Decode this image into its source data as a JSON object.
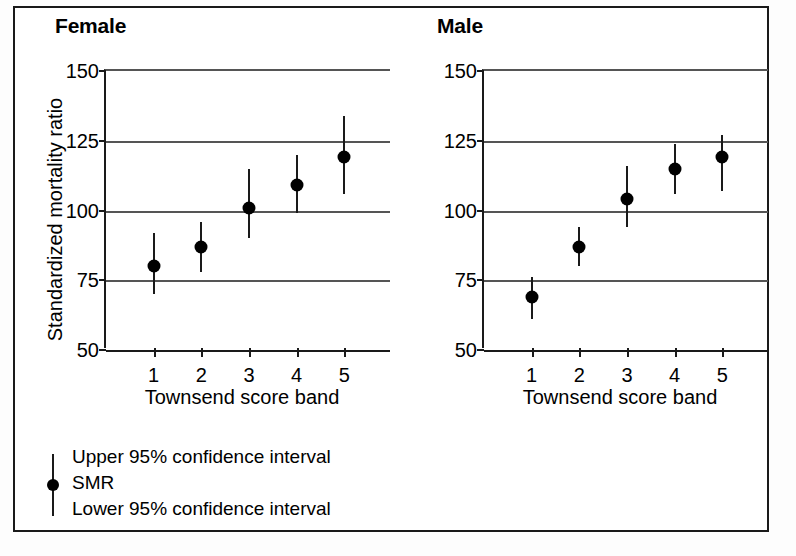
{
  "figure": {
    "y_axis_title": "Standardized mortality ratio",
    "x_axis_title": "Townsend score band"
  },
  "legend": {
    "upper": "Upper 95% confidence interval",
    "smr": "SMR",
    "lower": "Lower 95% confidence interval"
  },
  "chart_data": [
    {
      "type": "scatter",
      "title": "Female",
      "xlabel": "Townsend score band",
      "ylabel": "Standardized mortality ratio",
      "categories": [
        "1",
        "2",
        "3",
        "4",
        "5"
      ],
      "x": [
        1,
        2,
        3,
        4,
        5
      ],
      "values": [
        80,
        87,
        101,
        109,
        119
      ],
      "ci_lower": [
        70,
        78,
        90,
        99,
        106
      ],
      "ci_upper": [
        92,
        96,
        115,
        120,
        134
      ],
      "ylim": [
        50,
        150
      ],
      "yticks": [
        50,
        75,
        100,
        125,
        150
      ],
      "grid": true,
      "legend_position": "below-left",
      "marker": "filled-circle",
      "errorbar": "95% confidence interval"
    },
    {
      "type": "scatter",
      "title": "Male",
      "xlabel": "Townsend score band",
      "ylabel": "Standardized mortality ratio",
      "categories": [
        "1",
        "2",
        "3",
        "4",
        "5"
      ],
      "x": [
        1,
        2,
        3,
        4,
        5
      ],
      "values": [
        69,
        87,
        104,
        115,
        119
      ],
      "ci_lower": [
        61,
        80,
        94,
        106,
        107
      ],
      "ci_upper": [
        76,
        94,
        116,
        124,
        127
      ],
      "ylim": [
        50,
        150
      ],
      "yticks": [
        50,
        75,
        100,
        125,
        150
      ],
      "grid": true,
      "legend_position": "below-left",
      "marker": "filled-circle",
      "errorbar": "95% confidence interval"
    }
  ]
}
